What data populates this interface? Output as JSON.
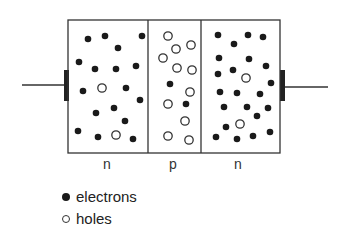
{
  "diagram": {
    "regions": [
      {
        "label": "n",
        "x": 107
      },
      {
        "label": "p",
        "x": 173
      },
      {
        "label": "n",
        "x": 238
      }
    ],
    "legend": [
      {
        "symbol": "filled-circle",
        "label": "electrons"
      },
      {
        "symbol": "open-circle",
        "label": "holes"
      }
    ],
    "electrons": [
      [
        88,
        39
      ],
      [
        105,
        36
      ],
      [
        118,
        48
      ],
      [
        142,
        36
      ],
      [
        79,
        62
      ],
      [
        95,
        69
      ],
      [
        116,
        69
      ],
      [
        136,
        66
      ],
      [
        83,
        91
      ],
      [
        126,
        88
      ],
      [
        140,
        100
      ],
      [
        96,
        113
      ],
      [
        114,
        108
      ],
      [
        125,
        121
      ],
      [
        78,
        131
      ],
      [
        98,
        137
      ],
      [
        133,
        139
      ],
      [
        170,
        84
      ],
      [
        186,
        104
      ],
      [
        218,
        35
      ],
      [
        248,
        35
      ],
      [
        263,
        37
      ],
      [
        234,
        44
      ],
      [
        219,
        58
      ],
      [
        249,
        59
      ],
      [
        266,
        66
      ],
      [
        218,
        74
      ],
      [
        233,
        70
      ],
      [
        271,
        83
      ],
      [
        220,
        92
      ],
      [
        237,
        93
      ],
      [
        260,
        94
      ],
      [
        224,
        107
      ],
      [
        247,
        107
      ],
      [
        268,
        108
      ],
      [
        257,
        116
      ],
      [
        226,
        127
      ],
      [
        216,
        137
      ],
      [
        237,
        139
      ],
      [
        253,
        136
      ],
      [
        270,
        132
      ]
    ],
    "holes": [
      [
        102,
        88
      ],
      [
        116,
        135
      ],
      [
        168,
        36
      ],
      [
        176,
        49
      ],
      [
        191,
        45
      ],
      [
        163,
        58
      ],
      [
        177,
        68
      ],
      [
        192,
        70
      ],
      [
        190,
        92
      ],
      [
        168,
        104
      ],
      [
        185,
        121
      ],
      [
        168,
        136
      ],
      [
        189,
        140
      ],
      [
        246,
        78
      ],
      [
        240,
        124
      ]
    ]
  }
}
